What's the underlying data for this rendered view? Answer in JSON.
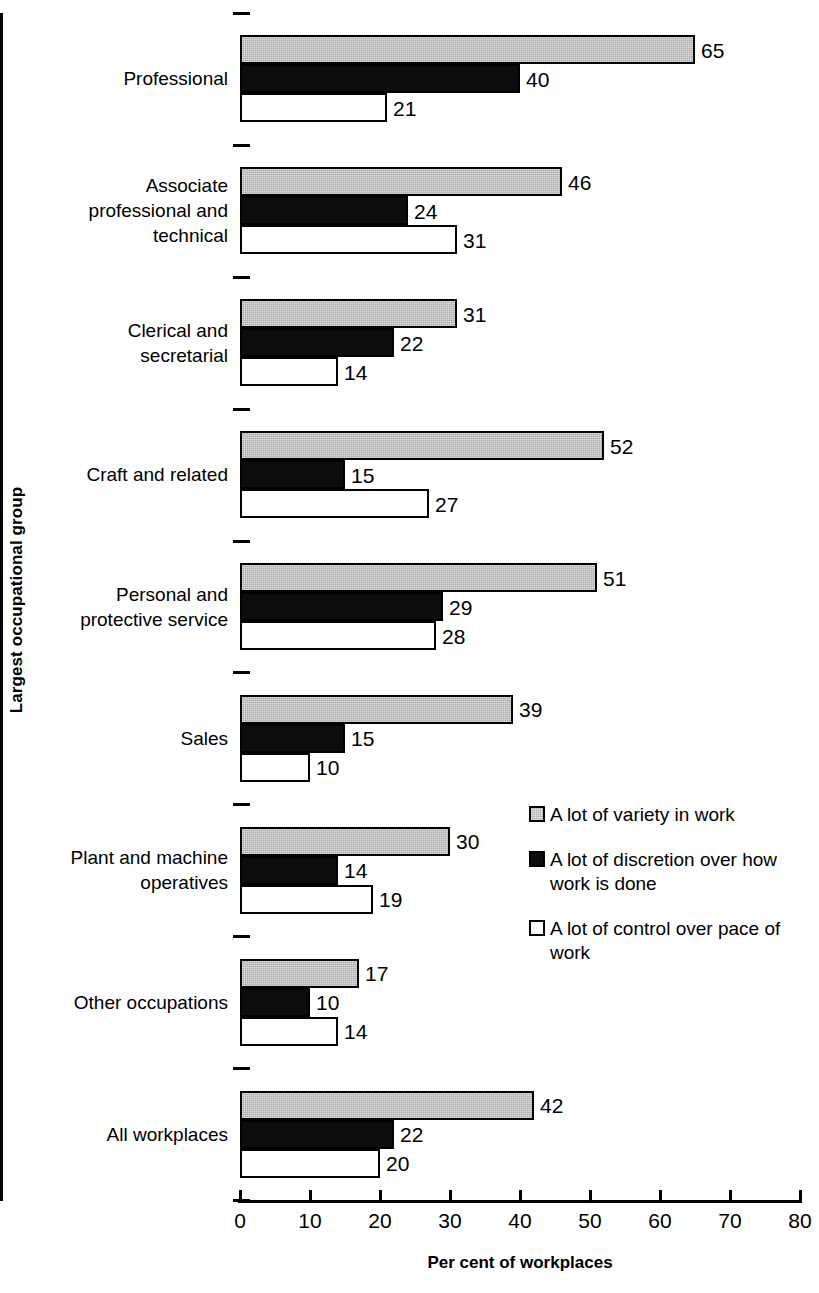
{
  "chart_data": {
    "type": "bar",
    "orientation": "horizontal",
    "title": "",
    "xlabel": "Per cent of workplaces",
    "ylabel": "Largest occupational group",
    "xlim": [
      0,
      80
    ],
    "xticks": [
      0,
      10,
      20,
      30,
      40,
      50,
      60,
      70,
      80
    ],
    "grid": false,
    "legend_position": "center-right",
    "categories": [
      "Professional",
      "Associate professional and technical",
      "Clerical and secretarial",
      "Craft and related",
      "Personal and protective service",
      "Sales",
      "Plant and machine operatives",
      "Other occupations",
      "All workplaces"
    ],
    "category_lines": [
      [
        "Professional"
      ],
      [
        "Associate",
        "professional and",
        "technical"
      ],
      [
        "Clerical and",
        "secretarial"
      ],
      [
        "Craft and related"
      ],
      [
        "Personal and",
        "protective service"
      ],
      [
        "Sales"
      ],
      [
        "Plant and machine",
        "operatives"
      ],
      [
        "Other occupations"
      ],
      [
        "All workplaces"
      ]
    ],
    "series": [
      {
        "name": "A lot of variety in work",
        "key": "variety",
        "color": "#ababab",
        "values": [
          65,
          46,
          31,
          52,
          51,
          39,
          30,
          17,
          42
        ]
      },
      {
        "name": "A lot of discretion over how work is done",
        "key": "discretion",
        "color": "#0d0d0d",
        "values": [
          40,
          24,
          22,
          15,
          29,
          15,
          14,
          10,
          22
        ]
      },
      {
        "name": "A lot of control over pace of work",
        "key": "control",
        "color": "#ffffff",
        "values": [
          21,
          31,
          14,
          27,
          28,
          10,
          19,
          14,
          20
        ]
      }
    ]
  },
  "legend": {
    "items": [
      {
        "label_lines": [
          "A lot of variety in work"
        ],
        "key": "variety"
      },
      {
        "label_lines": [
          "A lot of discretion over how",
          "work is done"
        ],
        "key": "discretion"
      },
      {
        "label_lines": [
          "A lot of control over pace of",
          "work"
        ],
        "key": "control"
      }
    ]
  },
  "axes": {
    "x_title": "Per cent of workplaces",
    "y_title": "Largest occupational group",
    "x_tick_labels": [
      "0",
      "10",
      "20",
      "30",
      "40",
      "50",
      "60",
      "70",
      "80"
    ]
  }
}
